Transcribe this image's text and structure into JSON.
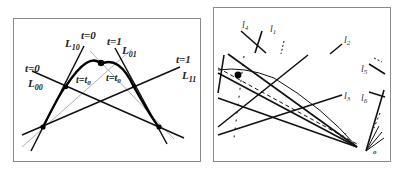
{
  "left_diagram": {
    "labels": {
      "t0_left": "t=0",
      "L00": "L",
      "L00_sub": "00",
      "t0_top": "t=0",
      "L10": "L",
      "L10_sub": "10",
      "t1_top": "t=1",
      "L01": "L",
      "L01_sub": "01",
      "t1_right": "t=1",
      "L11": "L",
      "L11_sub": "11",
      "t_eq_t0_left": "t=t",
      "t_eq_t0_left_sub": "0",
      "t_eq_t0_right": "t=t",
      "t_eq_t0_right_sub": "0"
    }
  },
  "right_diagram": {
    "labels": {
      "l4": "l",
      "l4_sub": "4",
      "l1": "l",
      "l1_sub": "1",
      "l2": "l",
      "l2_sub": "2",
      "l3": "l",
      "l3_sub": "3",
      "l5": "l",
      "l5_sub": "5",
      "l6": "l",
      "l6_sub": "6",
      "o_prime": "o'",
      "o": "o"
    }
  }
}
